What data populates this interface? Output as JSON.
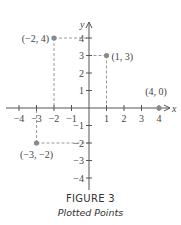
{
  "figure": {
    "title": "FIGURE 3",
    "subtitle": "Plotted Points"
  },
  "chart_data": {
    "type": "scatter",
    "title": "Plotted Points",
    "xlabel": "x",
    "ylabel": "y",
    "xlim": [
      -4,
      4
    ],
    "ylim": [
      -4,
      4
    ],
    "grid": false,
    "x_ticks": [
      -4,
      -3,
      -2,
      -1,
      1,
      2,
      3,
      4
    ],
    "y_ticks": [
      -4,
      -3,
      -2,
      -1,
      1,
      2,
      3,
      4
    ],
    "x_tick_labels": [
      "−4",
      "−3",
      "−2",
      "−1",
      "1",
      "2",
      "3",
      "4"
    ],
    "y_tick_labels": [
      "−4",
      "−3",
      "−2",
      "−1",
      "1",
      "2",
      "3",
      "4"
    ],
    "points": [
      {
        "x": -2,
        "y": 4,
        "label": "(−2, 4)",
        "dashed_guides": true
      },
      {
        "x": 1,
        "y": 3,
        "label": "(1, 3)",
        "dashed_guides": true
      },
      {
        "x": 4,
        "y": 0,
        "label": "(4, 0)",
        "dashed_guides": false
      },
      {
        "x": -3,
        "y": -2,
        "label": "(−3, −2)",
        "dashed_guides": true
      }
    ]
  },
  "colors": {
    "axis": "#555555",
    "point": "#8a8a8a",
    "guide": "#9a9a9a",
    "text": "#444444"
  }
}
